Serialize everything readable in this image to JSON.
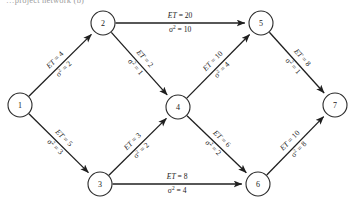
{
  "caption": {
    "partial_text": "…project network (b)"
  },
  "diagram": {
    "type": "directed-network",
    "colors": {
      "stroke": "#1f1f1f",
      "node_fill": "#ffffff",
      "text": "#1a1a1a"
    },
    "et_prefix": "ET",
    "var_prefix": "σ",
    "var_exponent": "2",
    "equals": "=",
    "nodes": [
      {
        "id": "1",
        "label": "1",
        "x": 20,
        "y": 105,
        "r": 12
      },
      {
        "id": "2",
        "label": "2",
        "x": 103,
        "y": 23,
        "r": 12
      },
      {
        "id": "3",
        "label": "3",
        "x": 100,
        "y": 184,
        "r": 12
      },
      {
        "id": "4",
        "label": "4",
        "x": 178,
        "y": 107,
        "r": 12
      },
      {
        "id": "5",
        "label": "5",
        "x": 261,
        "y": 23,
        "r": 12
      },
      {
        "id": "6",
        "label": "6",
        "x": 258,
        "y": 184,
        "r": 12
      },
      {
        "id": "7",
        "label": "7",
        "x": 335,
        "y": 105,
        "r": 12
      }
    ],
    "edges": [
      {
        "id": "e12",
        "from": "1",
        "to": "2",
        "et": "4",
        "var": "2",
        "et_label": "ET = 4",
        "var_label": "σ2 = 2"
      },
      {
        "id": "e13",
        "from": "1",
        "to": "3",
        "et": "5",
        "var": "3",
        "et_label": "ET = 5",
        "var_label": "σ2 = 3"
      },
      {
        "id": "e25",
        "from": "2",
        "to": "5",
        "et": "20",
        "var": "10",
        "et_label": "ET = 20",
        "var_label": "σ2 = 10"
      },
      {
        "id": "e24",
        "from": "2",
        "to": "4",
        "et": "2",
        "var": "1",
        "et_label": "ET = 2",
        "var_label": "σ2 = 1"
      },
      {
        "id": "e34",
        "from": "3",
        "to": "4",
        "et": "3",
        "var": "2",
        "et_label": "ET = 3",
        "var_label": "σ2 = 2"
      },
      {
        "id": "e36",
        "from": "3",
        "to": "6",
        "et": "8",
        "var": "4",
        "et_label": "ET = 8",
        "var_label": "σ2 = 4"
      },
      {
        "id": "e45",
        "from": "4",
        "to": "5",
        "et": "10",
        "var": "4",
        "et_label": "ET = 10",
        "var_label": "σ2 = 4"
      },
      {
        "id": "e46",
        "from": "4",
        "to": "6",
        "et": "6",
        "var": "2",
        "et_label": "ET = 6",
        "var_label": "σ2 = 2"
      },
      {
        "id": "e57",
        "from": "5",
        "to": "7",
        "et": "8",
        "var": "1",
        "et_label": "ET = 8",
        "var_label": "σ2 = 1"
      },
      {
        "id": "e67",
        "from": "6",
        "to": "7",
        "et": "10",
        "var": "8",
        "et_label": "ET = 10",
        "var_label": "σ2 = 8"
      }
    ]
  }
}
